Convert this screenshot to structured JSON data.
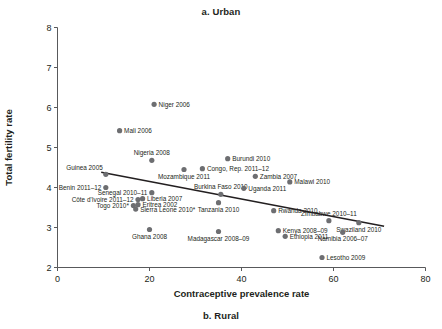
{
  "figure": {
    "top_title": "a. Urban",
    "bottom_title": "b. Rural"
  },
  "axes": {
    "x_title": "Contraceptive prevalence rate",
    "y_title": "Total fertility rate",
    "x_ticks": [
      "0",
      "20",
      "40",
      "60",
      "80"
    ],
    "y_ticks": [
      "2",
      "3",
      "4",
      "5",
      "6",
      "7",
      "8"
    ]
  },
  "chart_data": {
    "type": "scatter",
    "title": "a. Urban",
    "xlabel": "Contraceptive prevalence rate",
    "ylabel": "Total fertility rate",
    "xlim": [
      0,
      80
    ],
    "ylim": [
      2,
      8
    ],
    "xticks": [
      0,
      20,
      40,
      60,
      80
    ],
    "yticks": [
      2,
      3,
      4,
      5,
      6,
      7,
      8
    ],
    "grid": false,
    "legend": "none",
    "marker_color": "#6d6e71",
    "trendline": {
      "type": "linear-fit",
      "color": "#231f20",
      "x_start": 9.5,
      "y_start": 4.38,
      "x_end": 71.0,
      "y_end": 3.03
    },
    "points": [
      {
        "label": "Niger 2006",
        "x": 21.0,
        "y": 6.08,
        "label_pos": "right"
      },
      {
        "label": "Mali 2006",
        "x": 13.5,
        "y": 5.42,
        "label_pos": "right"
      },
      {
        "label": "Nigeria 2008",
        "x": 20.5,
        "y": 4.68,
        "label_pos": "above"
      },
      {
        "label": "Burundi 2010",
        "x": 37.0,
        "y": 4.72,
        "label_pos": "right"
      },
      {
        "label": "Guinea 2005",
        "x": 10.5,
        "y": 4.33,
        "label_pos": "above-left"
      },
      {
        "label": "Mozambique 2011",
        "x": 27.5,
        "y": 4.45,
        "label_pos": "below"
      },
      {
        "label": "Congo, Rep. 2011–12",
        "x": 31.5,
        "y": 4.47,
        "label_pos": "right"
      },
      {
        "label": "Zambia 2007",
        "x": 43.0,
        "y": 4.28,
        "label_pos": "right"
      },
      {
        "label": "Malawi 2010",
        "x": 50.5,
        "y": 4.14,
        "label_pos": "right"
      },
      {
        "label": "Benin 2011–12",
        "x": 10.5,
        "y": 4.0,
        "label_pos": "left"
      },
      {
        "label": "Burkina Faso 2010",
        "x": 35.5,
        "y": 3.83,
        "label_pos": "above"
      },
      {
        "label": "Uganda 2011",
        "x": 40.5,
        "y": 3.98,
        "label_pos": "right"
      },
      {
        "label": "Senegal 2010–11",
        "x": 20.5,
        "y": 3.87,
        "label_pos": "left"
      },
      {
        "label": "Liberia 2007",
        "x": 18.5,
        "y": 3.72,
        "label_pos": "right"
      },
      {
        "label": "Côte d'Ivoire 2011–12",
        "x": 17.5,
        "y": 3.7,
        "label_pos": "left"
      },
      {
        "label": "Tanzania 2010",
        "x": 35.0,
        "y": 3.62,
        "label_pos": "below"
      },
      {
        "label": "Eritrea 2002",
        "x": 17.5,
        "y": 3.57,
        "label_pos": "right"
      },
      {
        "label": "Togo 2010*",
        "x": 16.5,
        "y": 3.55,
        "label_pos": "left"
      },
      {
        "label": "Sierra Leone 2010*",
        "x": 17.0,
        "y": 3.46,
        "label_pos": "right"
      },
      {
        "label": "Rwanda 2010",
        "x": 47.0,
        "y": 3.42,
        "label_pos": "right"
      },
      {
        "label": "Zimbabwe 2010–11",
        "x": 59.0,
        "y": 3.17,
        "label_pos": "above"
      },
      {
        "label": "Swaziland 2010",
        "x": 65.5,
        "y": 3.12,
        "label_pos": "below"
      },
      {
        "label": "Ghana 2008",
        "x": 20.0,
        "y": 2.95,
        "label_pos": "below"
      },
      {
        "label": "Madagascar 2008–09",
        "x": 35.0,
        "y": 2.9,
        "label_pos": "below"
      },
      {
        "label": "Kenya 2008–09",
        "x": 48.0,
        "y": 2.92,
        "label_pos": "right"
      },
      {
        "label": "Namibia 2006–07",
        "x": 62.0,
        "y": 2.88,
        "label_pos": "below"
      },
      {
        "label": "Ethiopia 2011",
        "x": 49.5,
        "y": 2.78,
        "label_pos": "right"
      },
      {
        "label": "Lesotho 2009",
        "x": 57.5,
        "y": 2.25,
        "label_pos": "right"
      }
    ]
  }
}
